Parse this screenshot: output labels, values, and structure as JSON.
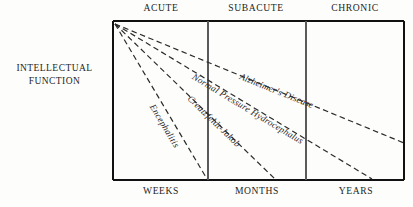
{
  "figure": {
    "y_axis_title": "INTELLECTUAL\nFUNCTION",
    "phase_labels": [
      {
        "text": "ACUTE",
        "x": 161
      },
      {
        "text": "SUBACUTE",
        "x": 256
      },
      {
        "text": "CHRONIC",
        "x": 355
      }
    ],
    "time_labels": [
      {
        "text": "WEEKS",
        "x": 161
      },
      {
        "text": "MONTHS",
        "x": 257
      },
      {
        "text": "YEARS",
        "x": 356
      }
    ],
    "frame": {
      "left": 113,
      "top": 21,
      "right": 404,
      "bottom": 180
    },
    "dividers": [
      208,
      306
    ],
    "colors": {
      "frame": "#111111",
      "divider": "#5a5a5a",
      "curve": "#2b2b2b",
      "text": "#241f1f"
    }
  },
  "chart_data": {
    "type": "line",
    "title": "",
    "xlabel": "",
    "ylabel": "INTELLECTUAL FUNCTION",
    "x_categories": [
      "WEEKS",
      "MONTHS",
      "YEARS"
    ],
    "top_categories": [
      "ACUTE",
      "SUBACUTE",
      "CHRONIC"
    ],
    "grid": false,
    "legend": "inline-on-curve",
    "series": [
      {
        "name": "Encephalitis",
        "label": "Encephalitis",
        "x1": 115,
        "y1": 24,
        "x2": 207,
        "y2": 179,
        "label_x": 152,
        "label_y": 100,
        "label_angle": 59
      },
      {
        "name": "Creutzfeldt-Jakob",
        "label": "Creutzfeldt-Jakob",
        "x1": 115,
        "y1": 24,
        "x2": 275,
        "y2": 179,
        "label_x": 189,
        "label_y": 92,
        "label_angle": 44
      },
      {
        "name": "Normal Pressure Hydrocephalus",
        "label": "Normal Pressure Hydrocephalus",
        "x1": 115,
        "y1": 24,
        "x2": 372,
        "y2": 179,
        "label_x": 193,
        "label_y": 71,
        "label_angle": 31
      },
      {
        "name": "Alzheimer's Disease",
        "label": "Alzheimer's Disease",
        "x1": 115,
        "y1": 24,
        "x2": 404,
        "y2": 143,
        "label_x": 240,
        "label_y": 71,
        "label_angle": 22
      }
    ]
  }
}
